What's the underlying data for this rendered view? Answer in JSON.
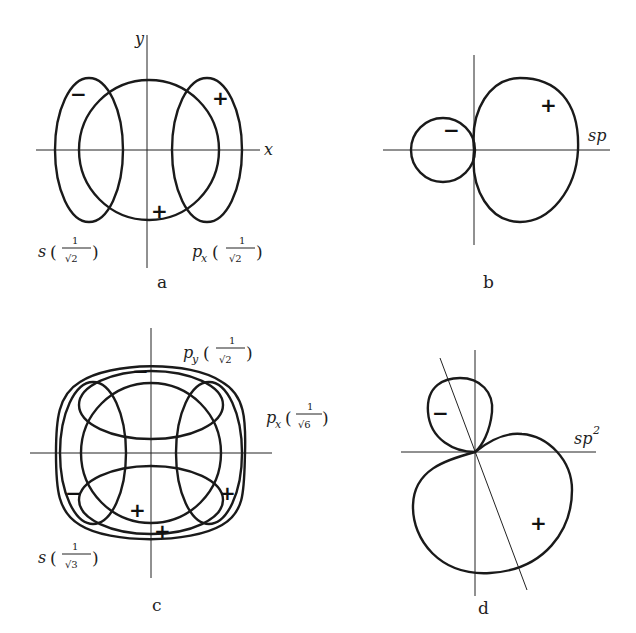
{
  "panels": {
    "a": {
      "caption": "a",
      "axis_x": "x",
      "axis_y": "y",
      "label_s": {
        "name": "s",
        "coef_num": "1",
        "coef_den": "√2"
      },
      "label_px": {
        "name": "p",
        "sub": "x",
        "coef_num": "1",
        "coef_den": "√2"
      },
      "signs": [
        "−",
        "+",
        "+"
      ]
    },
    "b": {
      "caption": "b",
      "label": "sp",
      "signs": [
        "−",
        "+"
      ]
    },
    "c": {
      "caption": "c",
      "label_py": {
        "name": "p",
        "sub": "y",
        "coef_num": "1",
        "coef_den": "√2"
      },
      "label_px": {
        "name": "p",
        "sub": "x",
        "coef_num": "1",
        "coef_den": "√6"
      },
      "label_s": {
        "name": "s",
        "coef_num": "1",
        "coef_den": "√3"
      },
      "signs": [
        "−",
        "−",
        "+",
        "+",
        "+"
      ]
    },
    "d": {
      "caption": "d",
      "label": "sp",
      "label_sup": "2",
      "signs": [
        "−",
        "+"
      ]
    }
  }
}
